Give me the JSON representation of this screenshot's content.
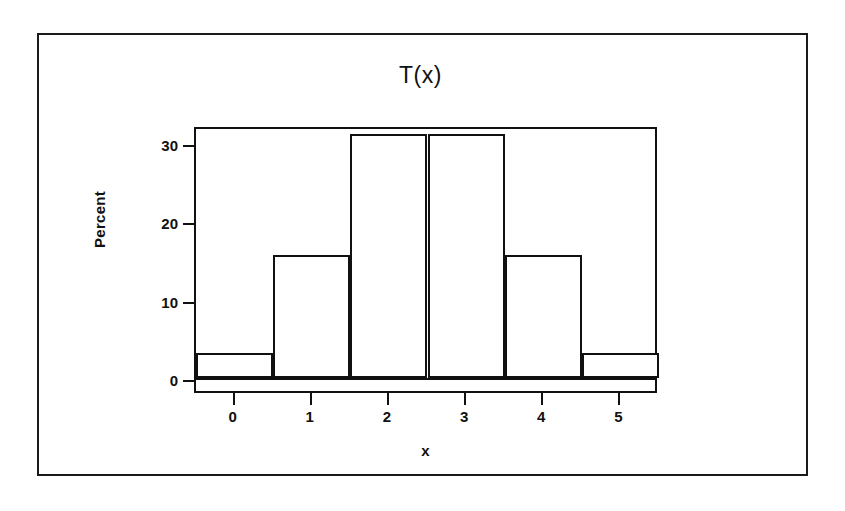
{
  "figure": {
    "title": "T(x)",
    "frame_color": "#1a1a1a",
    "background_color": "#ffffff"
  },
  "chart_data": {
    "type": "bar",
    "title": "T(x)",
    "subtitle": "",
    "xlabel": "x",
    "ylabel": "Percent",
    "categories": [
      "0",
      "1",
      "2",
      "3",
      "4",
      "5"
    ],
    "values": [
      3.2,
      15.7,
      31.2,
      31.2,
      15.7,
      3.2
    ],
    "series": [
      {
        "name": "Percent",
        "values": [
          3.2,
          15.7,
          31.2,
          31.2,
          15.7,
          3.2
        ]
      }
    ],
    "xlim": [
      -0.5,
      5.5
    ],
    "ylim": [
      0,
      32.3
    ],
    "xticks": [
      "0",
      "1",
      "2",
      "3",
      "4",
      "5"
    ],
    "yticks": [
      "0",
      "10",
      "20",
      "30"
    ],
    "ytick_values": [
      0,
      10,
      20,
      30
    ],
    "xtick_values": [
      0,
      1,
      2,
      3,
      4,
      5
    ],
    "bar_fill": "#ffffff",
    "bar_edge": "#111111",
    "grid": false,
    "legend": false,
    "legend_position": "none",
    "annotations": []
  }
}
